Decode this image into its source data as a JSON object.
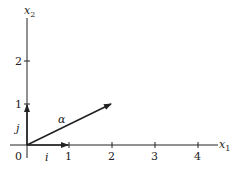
{
  "diagram": {
    "x_axis_label": "x",
    "x_axis_sub": "1",
    "y_axis_label": "x",
    "y_axis_sub": "2",
    "origin_label": "0",
    "x_ticks": [
      "1",
      "2",
      "3",
      "4"
    ],
    "y_ticks": [
      "1",
      "2"
    ],
    "vectors": [
      {
        "name": "i",
        "from": [
          0,
          0
        ],
        "to": [
          1,
          0
        ]
      },
      {
        "name": "j",
        "from": [
          0,
          0
        ],
        "to": [
          0,
          1
        ]
      },
      {
        "name": "α",
        "from": [
          0,
          0
        ],
        "to": [
          2,
          1
        ]
      }
    ],
    "vector_labels": {
      "i": "i",
      "j": "j",
      "alpha": "α"
    }
  }
}
